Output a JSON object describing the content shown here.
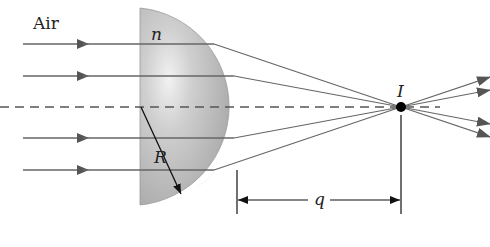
{
  "figure": {
    "type": "optics-refraction-diagram",
    "labels": {
      "medium": "Air",
      "refractive_index": "n",
      "radius": "R",
      "image_point": "I",
      "image_distance": "q"
    },
    "colors": {
      "lens_fill": "#b4b4b4",
      "lens_highlight": "#eeeeee",
      "ray": "#666666",
      "axis": "#555555",
      "ink": "#111111",
      "background": "#ffffff"
    },
    "incident_rays": 4,
    "emergent_rays": 4
  }
}
